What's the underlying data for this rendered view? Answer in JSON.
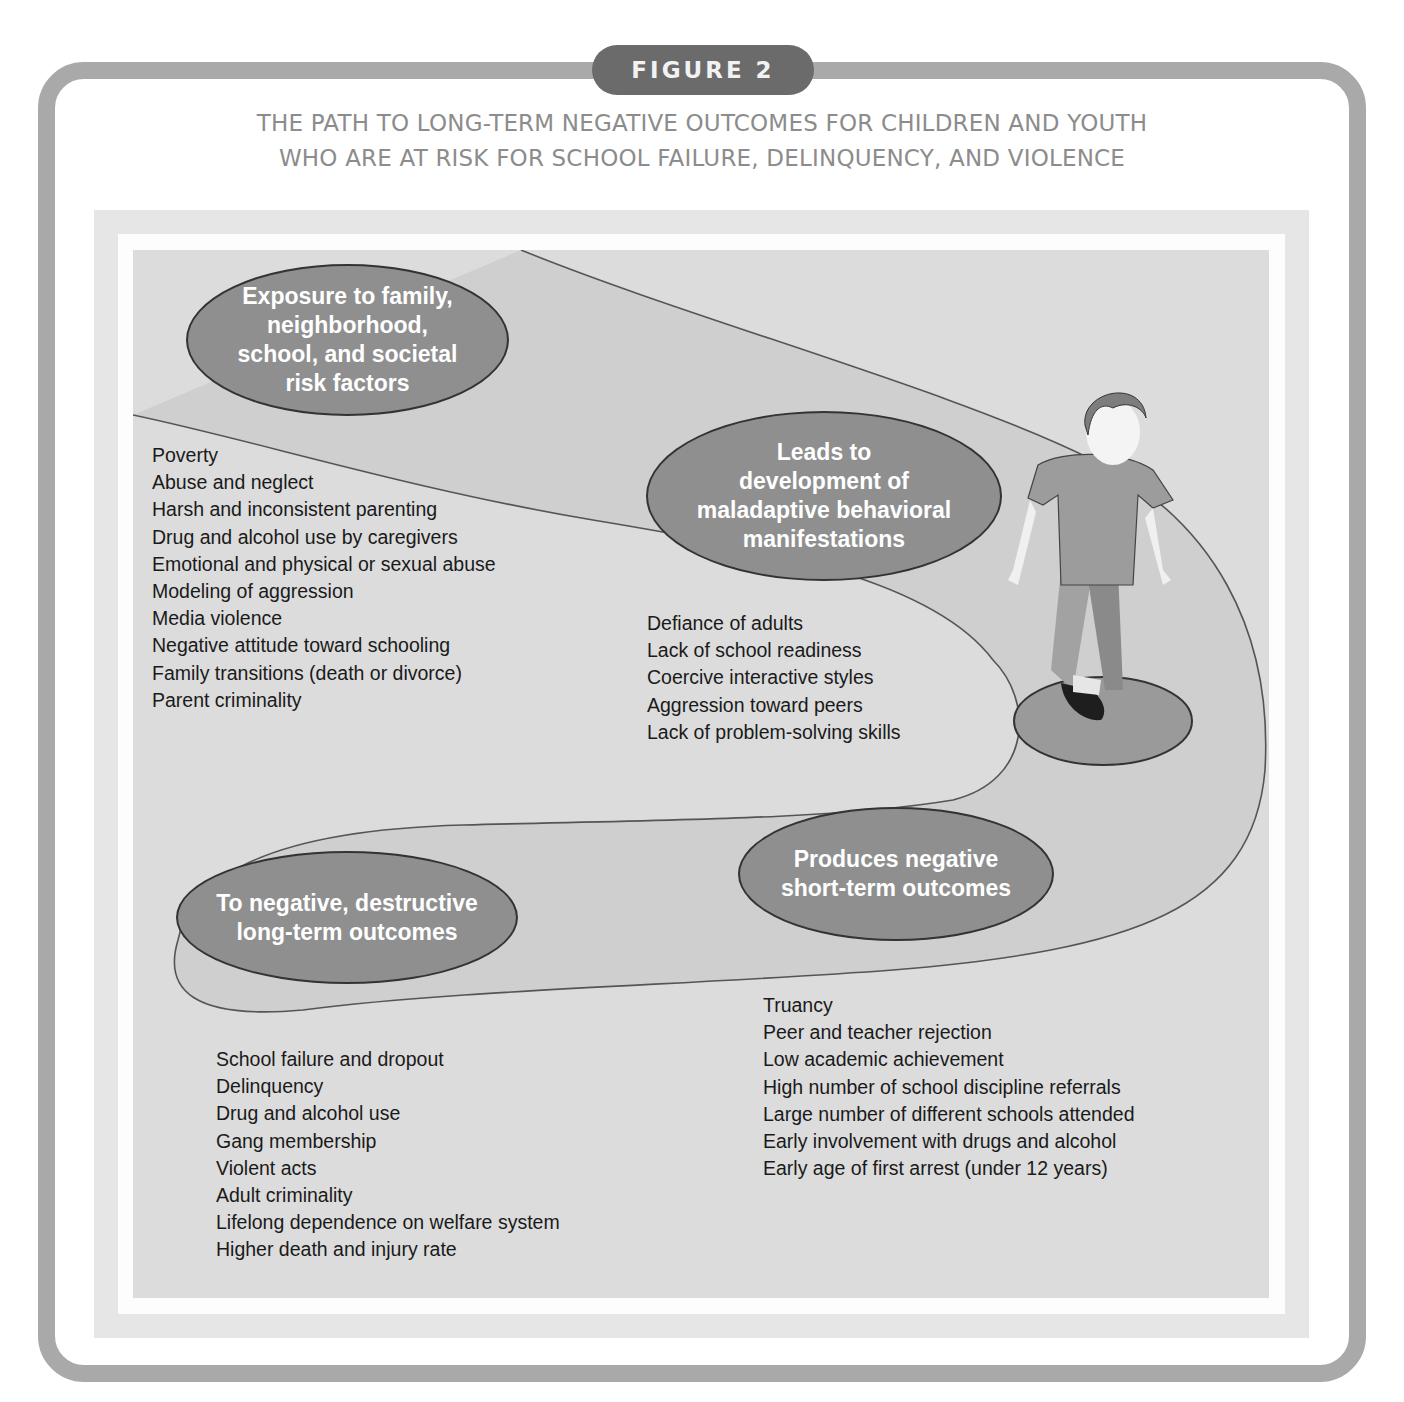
{
  "figure": {
    "badge_label": "FIGURE 2",
    "title_line1": "THE PATH TO LONG-TERM NEGATIVE OUTCOMES FOR CHILDREN AND YOUTH",
    "title_line2": "WHO ARE AT RISK FOR SCHOOL FAILURE, DELINQUENCY, AND VIOLENCE"
  },
  "diagram": {
    "colors": {
      "frame": "#a9a9a9",
      "badge": "#6b6b6b",
      "title": "#8c8c8c",
      "oval_fill": "#8f8f8f",
      "path_fill": "#cfcfcf",
      "background": "#dcdcdc"
    },
    "stages": [
      {
        "label": "Exposure to family,\nneighborhood,\nschool, and societal\nrisk factors",
        "items": [
          "Poverty",
          "Abuse and neglect",
          "Harsh and inconsistent parenting",
          "Drug and alcohol use by caregivers",
          "Emotional and physical or sexual abuse",
          "Modeling of aggression",
          "Media violence",
          "Negative attitude toward schooling",
          "Family transitions (death or divorce)",
          "Parent criminality"
        ]
      },
      {
        "label": "Leads to\ndevelopment of\nmaladaptive behavioral\nmanifestations",
        "items": [
          "Defiance of adults",
          "Lack of school readiness",
          "Coercive interactive styles",
          "Aggression toward peers",
          "Lack of problem-solving skills"
        ]
      },
      {
        "label": "Produces negative\nshort-term outcomes",
        "items": [
          "Truancy",
          "Peer and teacher rejection",
          "Low academic achievement",
          "High number of school discipline referrals",
          "Large number of different schools attended",
          "Early involvement with drugs and alcohol",
          "Early age of first arrest (under 12 years)"
        ]
      },
      {
        "label": "To negative, destructive\nlong-term outcomes",
        "items": [
          "School failure and dropout",
          "Delinquency",
          "Drug and alcohol use",
          "Gang membership",
          "Violent acts",
          "Adult criminality",
          "Lifelong dependence on welfare system",
          "Higher death and injury rate"
        ]
      }
    ],
    "illustration": "child-walking-on-path"
  }
}
